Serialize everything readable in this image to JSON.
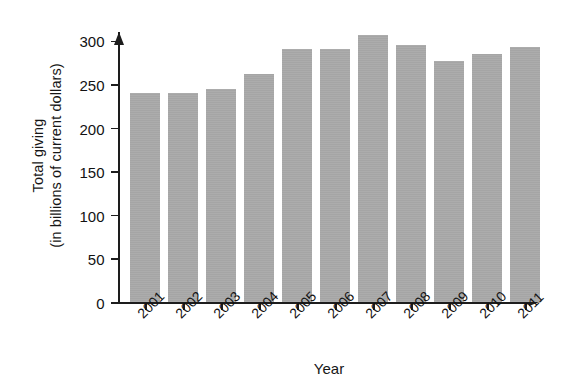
{
  "chart_data": {
    "type": "bar",
    "title": "",
    "subtitle": "",
    "xlabel": "Year",
    "ylabel_line1": "Total giving",
    "ylabel_line2": "(in billions of current dollars)",
    "ylabel": "Total giving (in billions of current dollars)",
    "categories": [
      "2001",
      "2002",
      "2003",
      "2004",
      "2005",
      "2006",
      "2007",
      "2008",
      "2009",
      "2010",
      "2011"
    ],
    "values": [
      240,
      240,
      245,
      262,
      290,
      290,
      306,
      295,
      277,
      285,
      293
    ],
    "ylim": [
      0,
      310
    ],
    "yticks": [
      0,
      50,
      100,
      150,
      200,
      250,
      300
    ],
    "ytick_labels": [
      "0",
      "50",
      "100",
      "150",
      "200",
      "250",
      "300"
    ],
    "grid": false,
    "legend": false,
    "legend_position": "none",
    "bar_color": "#a8a8a8",
    "axis_color": "#1d1d1d",
    "xtick_label_rotation": -45,
    "series": [
      {
        "name": "Total giving",
        "values": [
          240,
          240,
          245,
          262,
          290,
          290,
          306,
          295,
          277,
          285,
          293
        ]
      }
    ],
    "points": [
      {
        "year": "2001",
        "value": 240
      },
      {
        "year": "2002",
        "value": 240
      },
      {
        "year": "2003",
        "value": 245
      },
      {
        "year": "2004",
        "value": 262
      },
      {
        "year": "2005",
        "value": 290
      },
      {
        "year": "2006",
        "value": 290
      },
      {
        "year": "2007",
        "value": 306
      },
      {
        "year": "2008",
        "value": 295
      },
      {
        "year": "2009",
        "value": 277
      },
      {
        "year": "2010",
        "value": 285
      },
      {
        "year": "2011",
        "value": 293
      }
    ]
  }
}
